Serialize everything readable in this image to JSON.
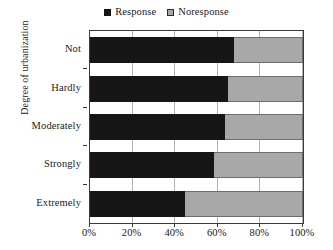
{
  "chart_data": {
    "type": "bar",
    "orientation": "horizontal",
    "stacked": true,
    "stacked_normalized": true,
    "title": "",
    "subtitle": "",
    "xlabel": "",
    "ylabel": "Degree of urbanization",
    "categories": [
      "Not",
      "Hardly",
      "Moderately",
      "Strongly",
      "Extremely"
    ],
    "series": [
      {
        "name": "Response",
        "color": "#161616",
        "values": [
          67.6,
          64.8,
          63.4,
          58.2,
          44.6
        ]
      },
      {
        "name": "Noresponse",
        "color": "#a8a8a8",
        "values": [
          32.4,
          35.2,
          36.6,
          41.8,
          55.4
        ]
      }
    ],
    "xlim": [
      0,
      100
    ],
    "ylim": [
      0,
      5
    ],
    "xticks": [
      0,
      20,
      40,
      60,
      80,
      100
    ],
    "xtick_labels": [
      "0%",
      "20%",
      "40%",
      "60%",
      "80%",
      "100%"
    ],
    "grid": "vertical",
    "legend_position": "top-center",
    "legend_entries": [
      "Response",
      "Noresponse"
    ]
  },
  "legend": {
    "response_label": "Response",
    "noresponse_label": "Noresponse"
  },
  "axes": {
    "y_title": "Degree of urbanization",
    "y_tick_labels": [
      "Not",
      "Hardly",
      "Moderately",
      "Strongly",
      "Extremely"
    ],
    "x_tick_labels": [
      "0%",
      "20%",
      "40%",
      "60%",
      "80%",
      "100%"
    ]
  },
  "colors": {
    "response": "#161616",
    "noresponse": "#a8a8a8",
    "frame": "#3a3a3a",
    "gridline": "#b4b4b4",
    "background": "#ffffff"
  }
}
